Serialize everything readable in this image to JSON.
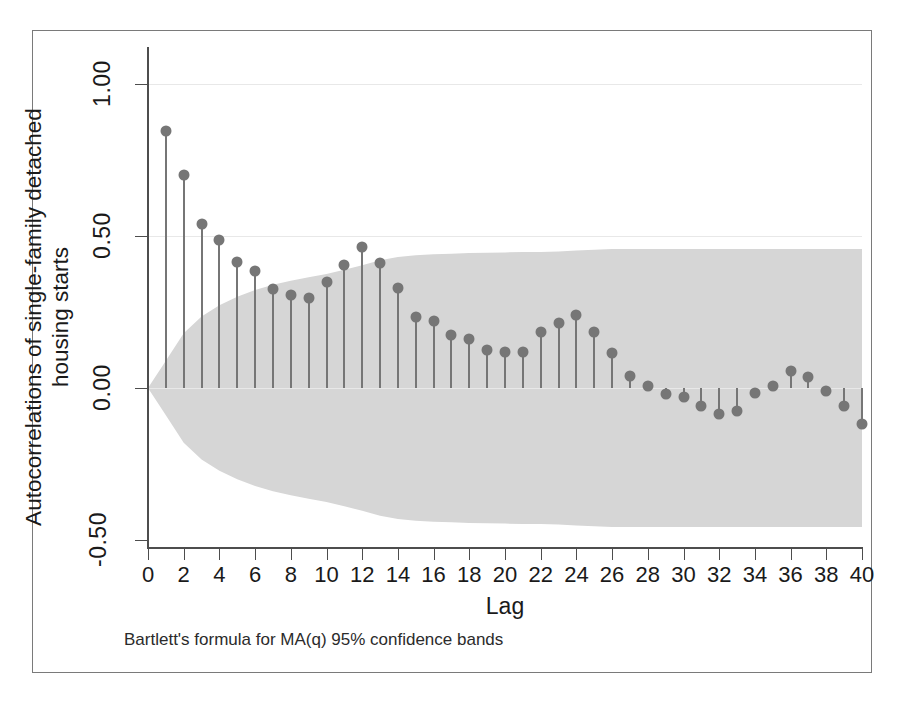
{
  "figure": {
    "footnote": "Bartlett's formula for MA(q) 95% confidence bands",
    "frame_color": "#7a7a7a",
    "axis_color": "#4d4d4d",
    "marker_color": "#767676",
    "band_color": "#d6d6d6",
    "background": "#ffffff"
  },
  "chart_data": {
    "type": "bar",
    "title": "",
    "subtitle": "",
    "xlabel": "Lag",
    "ylabel": "Autocorrelations of single-family detached housing starts",
    "ylabel_line1": "Autocorrelations of single-family detached",
    "ylabel_line2": "housing starts",
    "annotation": "Bartlett's formula for MA(q) 95% confidence bands",
    "grid": false,
    "legend": "none",
    "xlim": [
      0,
      40
    ],
    "ylim": [
      -0.5,
      1.0
    ],
    "xticks": [
      0,
      2,
      4,
      6,
      8,
      10,
      12,
      14,
      16,
      18,
      20,
      22,
      24,
      26,
      28,
      30,
      32,
      34,
      36,
      38,
      40
    ],
    "xticklabels": [
      "0",
      "2",
      "4",
      "6",
      "8",
      "10",
      "12",
      "14",
      "16",
      "18",
      "20",
      "22",
      "24",
      "26",
      "28",
      "30",
      "32",
      "34",
      "36",
      "38",
      "40"
    ],
    "yticks": [
      1.0,
      0.5,
      0.0,
      -0.5
    ],
    "yticklabels": [
      "1.00",
      "0.50",
      "0.00",
      "-0.50"
    ],
    "categories": [
      1,
      2,
      3,
      4,
      5,
      6,
      7,
      8,
      9,
      10,
      11,
      12,
      13,
      14,
      15,
      16,
      17,
      18,
      19,
      20,
      21,
      22,
      23,
      24,
      25,
      26,
      27,
      28,
      29,
      30,
      31,
      32,
      33,
      34,
      35,
      36,
      37,
      38,
      39,
      40
    ],
    "values": [
      0.845,
      0.7,
      0.54,
      0.487,
      0.415,
      0.385,
      0.325,
      0.305,
      0.295,
      0.35,
      0.405,
      0.465,
      0.41,
      0.33,
      0.235,
      0.22,
      0.175,
      0.16,
      0.125,
      0.12,
      0.12,
      0.185,
      0.215,
      0.24,
      0.185,
      0.115,
      0.04,
      0.005,
      -0.02,
      -0.03,
      -0.06,
      -0.085,
      -0.075,
      -0.015,
      0.005,
      0.055,
      0.035,
      -0.01,
      -0.06,
      -0.12
    ],
    "confidence_band": {
      "label": "Bartlett 95% confidence band",
      "upper": [
        0.09,
        0.18,
        0.235,
        0.272,
        0.3,
        0.322,
        0.34,
        0.353,
        0.364,
        0.375,
        0.389,
        0.404,
        0.42,
        0.431,
        0.437,
        0.44,
        0.442,
        0.444,
        0.445,
        0.446,
        0.447,
        0.447,
        0.449,
        0.452,
        0.455,
        0.457,
        0.457,
        0.457,
        0.457,
        0.457,
        0.457,
        0.457,
        0.457,
        0.457,
        0.457,
        0.457,
        0.457,
        0.457,
        0.457,
        0.457
      ],
      "lower": [
        -0.09,
        -0.18,
        -0.235,
        -0.272,
        -0.3,
        -0.322,
        -0.34,
        -0.353,
        -0.364,
        -0.375,
        -0.389,
        -0.404,
        -0.42,
        -0.431,
        -0.437,
        -0.44,
        -0.442,
        -0.444,
        -0.445,
        -0.446,
        -0.447,
        -0.447,
        -0.449,
        -0.452,
        -0.455,
        -0.457,
        -0.457,
        -0.457,
        -0.457,
        -0.457,
        -0.457,
        -0.457,
        -0.457,
        -0.457,
        -0.457,
        -0.457,
        -0.457,
        -0.457,
        -0.457,
        -0.457
      ]
    }
  }
}
